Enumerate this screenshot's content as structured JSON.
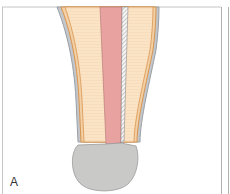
{
  "figure": {
    "panel_label": "A",
    "colors": {
      "background": "#ffffff",
      "frame": "#b8b8b8",
      "dentin": "#fbe3c6",
      "cementum_line": "#d9954f",
      "root_outline": "#9aa0a6",
      "canal": "#e8a3a0",
      "gutta_strip": "#f4f4f4",
      "apical_ball": "#c9cac8",
      "ball_outline": "#9a9a9a"
    }
  }
}
